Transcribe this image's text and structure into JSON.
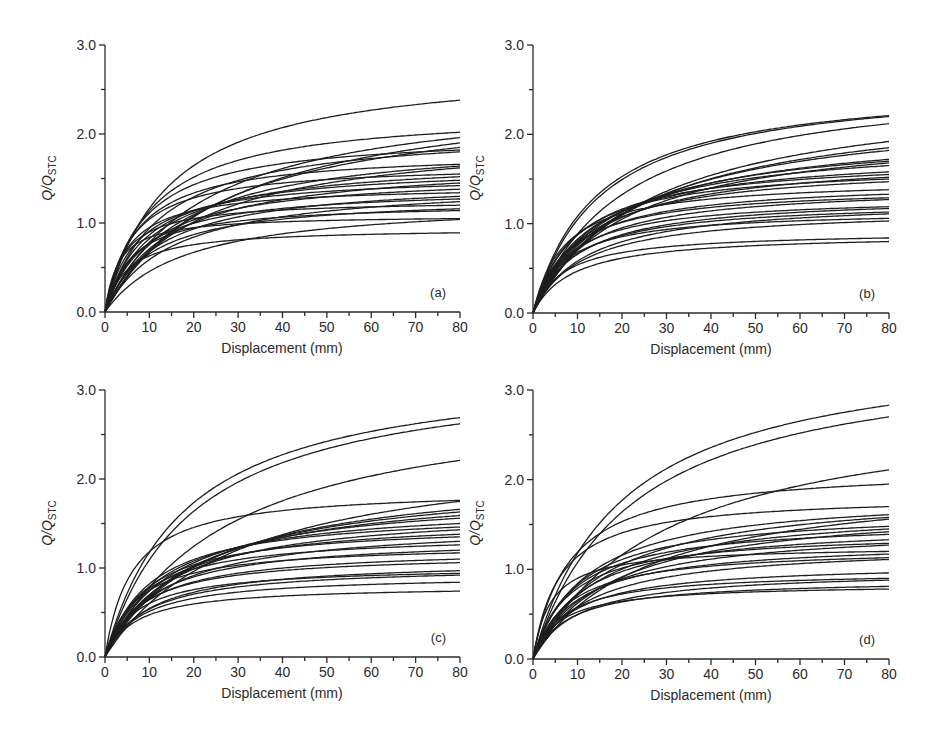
{
  "figure": {
    "panels": [
      "a",
      "b",
      "c",
      "d"
    ]
  },
  "chart_data": [
    {
      "type": "line",
      "panel_label": "(a)",
      "title": "",
      "xlabel": "Displacement (mm)",
      "ylabel": "Q/Q_STC",
      "ylabel_main": "Q/Q",
      "ylabel_sub": "STC",
      "xlim": [
        0,
        80
      ],
      "ylim": [
        0,
        3.0
      ],
      "xticks": [
        0,
        10,
        20,
        30,
        40,
        50,
        60,
        70,
        80
      ],
      "yticks": [
        "0.0",
        "1.0",
        "2.0",
        "3.0"
      ],
      "grid": false,
      "legend": "none",
      "series_description": "Family of normalized load-displacement curves; values listed are Q/Q_STC at 80 mm with knee displacement (mm)",
      "series": [
        {
          "v80": 2.38,
          "knee": 14
        },
        {
          "v80": 2.02,
          "knee": 10
        },
        {
          "v80": 1.96,
          "knee": 22
        },
        {
          "v80": 1.9,
          "knee": 28
        },
        {
          "v80": 1.85,
          "knee": 25
        },
        {
          "v80": 1.82,
          "knee": 8
        },
        {
          "v80": 1.8,
          "knee": 12
        },
        {
          "v80": 1.66,
          "knee": 7
        },
        {
          "v80": 1.64,
          "knee": 16
        },
        {
          "v80": 1.62,
          "knee": 20
        },
        {
          "v80": 1.55,
          "knee": 6
        },
        {
          "v80": 1.52,
          "knee": 11
        },
        {
          "v80": 1.48,
          "knee": 9
        },
        {
          "v80": 1.45,
          "knee": 14
        },
        {
          "v80": 1.42,
          "knee": 7
        },
        {
          "v80": 1.38,
          "knee": 10
        },
        {
          "v80": 1.34,
          "knee": 5
        },
        {
          "v80": 1.3,
          "knee": 12
        },
        {
          "v80": 1.27,
          "knee": 8
        },
        {
          "v80": 1.24,
          "knee": 15
        },
        {
          "v80": 1.2,
          "knee": 4
        },
        {
          "v80": 1.16,
          "knee": 10
        },
        {
          "v80": 1.14,
          "knee": 6
        },
        {
          "v80": 1.05,
          "knee": 3
        },
        {
          "v80": 1.04,
          "knee": 18
        },
        {
          "v80": 0.89,
          "knee": 5
        }
      ]
    },
    {
      "type": "line",
      "panel_label": "(b)",
      "title": "",
      "xlabel": "Displacement (mm)",
      "ylabel": "Q/Q_STC",
      "ylabel_main": "Q/Q",
      "ylabel_sub": "STC",
      "xlim": [
        0,
        80
      ],
      "ylim": [
        0,
        3.0
      ],
      "xticks": [
        0,
        10,
        20,
        30,
        40,
        50,
        60,
        70,
        80
      ],
      "yticks": [
        "0.0",
        "1.0",
        "2.0",
        "3.0"
      ],
      "grid": false,
      "legend": "none",
      "series": [
        {
          "v80": 2.21,
          "knee": 14
        },
        {
          "v80": 2.2,
          "knee": 15
        },
        {
          "v80": 2.12,
          "knee": 20
        },
        {
          "v80": 1.92,
          "knee": 26
        },
        {
          "v80": 1.85,
          "knee": 24
        },
        {
          "v80": 1.82,
          "knee": 22
        },
        {
          "v80": 1.72,
          "knee": 18
        },
        {
          "v80": 1.7,
          "knee": 16
        },
        {
          "v80": 1.68,
          "knee": 20
        },
        {
          "v80": 1.65,
          "knee": 14
        },
        {
          "v80": 1.58,
          "knee": 12
        },
        {
          "v80": 1.55,
          "knee": 10
        },
        {
          "v80": 1.52,
          "knee": 13
        },
        {
          "v80": 1.5,
          "knee": 9
        },
        {
          "v80": 1.47,
          "knee": 11
        },
        {
          "v80": 1.38,
          "knee": 7
        },
        {
          "v80": 1.33,
          "knee": 9
        },
        {
          "v80": 1.29,
          "knee": 8
        },
        {
          "v80": 1.27,
          "knee": 10
        },
        {
          "v80": 1.19,
          "knee": 8
        },
        {
          "v80": 1.17,
          "knee": 10
        },
        {
          "v80": 1.13,
          "knee": 9
        },
        {
          "v80": 1.11,
          "knee": 12
        },
        {
          "v80": 1.06,
          "knee": 7
        },
        {
          "v80": 1.03,
          "knee": 11
        },
        {
          "v80": 0.84,
          "knee": 7
        },
        {
          "v80": 0.8,
          "knee": 9
        }
      ]
    },
    {
      "type": "line",
      "panel_label": "(c)",
      "title": "",
      "xlabel": "Displacement (mm)",
      "ylabel": "Q/Q_STC",
      "ylabel_main": "Q/Q",
      "ylabel_sub": "STC",
      "xlim": [
        0,
        80
      ],
      "ylim": [
        0,
        3.0
      ],
      "xticks": [
        0,
        10,
        20,
        30,
        40,
        50,
        60,
        70,
        80
      ],
      "yticks": [
        "0.0",
        "1.0",
        "2.0",
        "3.0"
      ],
      "grid": false,
      "legend": "none",
      "series": [
        {
          "v80": 2.69,
          "knee": 18
        },
        {
          "v80": 2.62,
          "knee": 20
        },
        {
          "v80": 2.21,
          "knee": 28
        },
        {
          "v80": 1.76,
          "knee": 6
        },
        {
          "v80": 1.75,
          "knee": 30
        },
        {
          "v80": 1.66,
          "knee": 22
        },
        {
          "v80": 1.63,
          "knee": 20
        },
        {
          "v80": 1.59,
          "knee": 18
        },
        {
          "v80": 1.56,
          "knee": 15
        },
        {
          "v80": 1.5,
          "knee": 12
        },
        {
          "v80": 1.46,
          "knee": 10
        },
        {
          "v80": 1.43,
          "knee": 14
        },
        {
          "v80": 1.38,
          "knee": 11
        },
        {
          "v80": 1.35,
          "knee": 9
        },
        {
          "v80": 1.3,
          "knee": 13
        },
        {
          "v80": 1.26,
          "knee": 8
        },
        {
          "v80": 1.2,
          "knee": 10
        },
        {
          "v80": 1.17,
          "knee": 7
        },
        {
          "v80": 1.1,
          "knee": 9
        },
        {
          "v80": 1.06,
          "knee": 8
        },
        {
          "v80": 0.97,
          "knee": 10
        },
        {
          "v80": 0.94,
          "knee": 7
        },
        {
          "v80": 0.92,
          "knee": 9
        },
        {
          "v80": 0.84,
          "knee": 8
        },
        {
          "v80": 0.74,
          "knee": 7
        }
      ]
    },
    {
      "type": "line",
      "panel_label": "(d)",
      "title": "",
      "xlabel": "Displacement (mm)",
      "ylabel": "Q/Q_STC",
      "ylabel_main": "Q/Q",
      "ylabel_sub": "STC",
      "xlim": [
        0,
        80
      ],
      "ylim": [
        0,
        3.0
      ],
      "xticks": [
        0,
        10,
        20,
        30,
        40,
        50,
        60,
        70,
        80
      ],
      "yticks": [
        "0.0",
        "1.0",
        "2.0",
        "3.0"
      ],
      "grid": false,
      "legend": "none",
      "series": [
        {
          "v80": 2.83,
          "knee": 20
        },
        {
          "v80": 2.7,
          "knee": 22
        },
        {
          "v80": 2.11,
          "knee": 30
        },
        {
          "v80": 1.95,
          "knee": 8
        },
        {
          "v80": 1.7,
          "knee": 6
        },
        {
          "v80": 1.61,
          "knee": 12
        },
        {
          "v80": 1.58,
          "knee": 16
        },
        {
          "v80": 1.56,
          "knee": 25
        },
        {
          "v80": 1.48,
          "knee": 10
        },
        {
          "v80": 1.45,
          "knee": 14
        },
        {
          "v80": 1.42,
          "knee": 18
        },
        {
          "v80": 1.39,
          "knee": 9
        },
        {
          "v80": 1.33,
          "knee": 11
        },
        {
          "v80": 1.29,
          "knee": 8
        },
        {
          "v80": 1.27,
          "knee": 13
        },
        {
          "v80": 1.2,
          "knee": 4
        },
        {
          "v80": 1.17,
          "knee": 10
        },
        {
          "v80": 1.13,
          "knee": 8
        },
        {
          "v80": 1.11,
          "knee": 12
        },
        {
          "v80": 0.96,
          "knee": 9
        },
        {
          "v80": 0.9,
          "knee": 7
        },
        {
          "v80": 0.88,
          "knee": 10
        },
        {
          "v80": 0.81,
          "knee": 8
        },
        {
          "v80": 0.78,
          "knee": 6
        }
      ]
    }
  ]
}
